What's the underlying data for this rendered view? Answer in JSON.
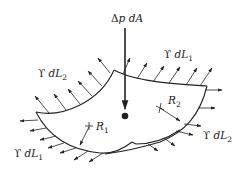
{
  "figure": {
    "labels": {
      "pressure": {
        "symbol": "Δ",
        "var": "p",
        "tail": " dA"
      },
      "tension_top_right": {
        "symbol": "ϒ",
        "d": " d",
        "var": "L",
        "sub": "1"
      },
      "tension_top_left": {
        "symbol": "ϒ",
        "d": " d",
        "var": "L",
        "sub": "2"
      },
      "tension_bottom_right": {
        "symbol": "ϒ",
        "d": " d",
        "var": "L",
        "sub": "2"
      },
      "tension_bottom_left": {
        "symbol": "ϒ",
        "d": " d",
        "var": "L",
        "sub": "1"
      },
      "radius_1": {
        "var": "R",
        "sub": "1"
      },
      "radius_2": {
        "var": "R",
        "sub": "2"
      }
    },
    "colors": {
      "ink": "#222222",
      "background": "#ffffff"
    }
  }
}
